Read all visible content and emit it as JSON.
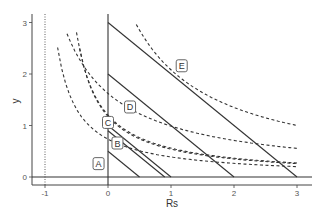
{
  "chart_data": {
    "type": "line",
    "title": "",
    "xlabel": "Rs",
    "ylabel": "y",
    "xlim": [
      -1.1,
      3.2
    ],
    "ylim": [
      -0.15,
      3.15
    ],
    "x_ticks": [
      "-1",
      "0",
      "1",
      "2",
      "3"
    ],
    "y_ticks": [
      "0",
      "1",
      "2",
      "3"
    ],
    "grid": false,
    "legend": "none",
    "reference_lines": [
      {
        "name": "x=-1",
        "style": "dotted",
        "x": -1
      },
      {
        "name": "x=0",
        "style": "solid",
        "x": 0
      },
      {
        "name": "y=0",
        "style": "solid",
        "y": 0
      }
    ],
    "series": [
      {
        "name": "A",
        "style": "solid",
        "points": [
          [
            0,
            0.5
          ],
          [
            0.5,
            0
          ]
        ]
      },
      {
        "name": "B",
        "style": "solid",
        "points": [
          [
            0,
            0.9
          ],
          [
            0.9,
            0
          ]
        ]
      },
      {
        "name": "C",
        "style": "solid",
        "points": [
          [
            0,
            1.0
          ],
          [
            1.0,
            0
          ]
        ]
      },
      {
        "name": "D",
        "style": "solid",
        "points": [
          [
            0,
            2.0
          ],
          [
            2.0,
            0
          ]
        ]
      },
      {
        "name": "E",
        "style": "solid",
        "points": [
          [
            0,
            3.0
          ],
          [
            3.0,
            0
          ]
        ]
      },
      {
        "name": "A-curve",
        "style": "dashed",
        "k": 0.83,
        "x0": -1.13,
        "x_range": [
          -0.8,
          3.0
        ]
      },
      {
        "name": "B-curve",
        "style": "dashed",
        "k": 1.0,
        "x0": -0.85,
        "x_range": [
          -0.45,
          3.0
        ]
      },
      {
        "name": "C-curve",
        "style": "dashed",
        "k": 1.05,
        "x0": -0.874,
        "x_range": [
          -0.5,
          3.0
        ]
      },
      {
        "name": "D-curve",
        "style": "dashed",
        "k": 2.53,
        "x0": -1.56,
        "x_range": [
          -0.65,
          3.0
        ]
      },
      {
        "name": "E-curve",
        "style": "dashed",
        "k": 3.85,
        "x0": -0.85,
        "x_range": [
          0.45,
          3.0
        ]
      }
    ],
    "annotations": [
      {
        "text": "A",
        "x": -0.15,
        "y": 0.25
      },
      {
        "text": "B",
        "x": 0.15,
        "y": 0.65
      },
      {
        "text": "C",
        "x": 0.0,
        "y": 1.05
      },
      {
        "text": "D",
        "x": 0.35,
        "y": 1.35
      },
      {
        "text": "E",
        "x": 1.17,
        "y": 2.15
      }
    ]
  },
  "colors": {
    "line": "#333333",
    "axis": "#444444",
    "label_box": "#555555"
  }
}
